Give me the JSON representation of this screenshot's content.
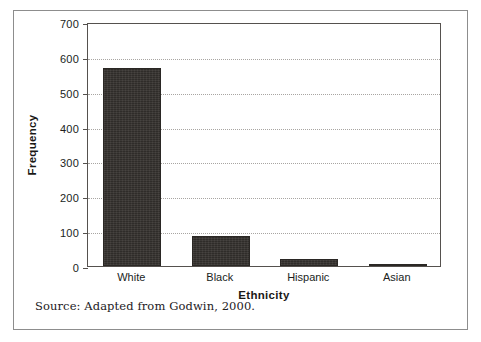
{
  "figure": {
    "source_note": "Source: Adapted from Godwin, 2000."
  },
  "chart_data": {
    "type": "bar",
    "title": "",
    "xlabel": "Ethnicity",
    "ylabel": "Frequency",
    "categories": [
      "White",
      "Black",
      "Hispanic",
      "Asian"
    ],
    "values": [
      567,
      87,
      20,
      5
    ],
    "ylim": [
      0,
      700
    ],
    "yticks": [
      0,
      100,
      200,
      300,
      400,
      500,
      600,
      700
    ],
    "ytick_labels": [
      "0",
      "100",
      "200",
      "300",
      "400",
      "500",
      "600",
      "700"
    ],
    "grid": "horizontal-dotted",
    "legend": "none",
    "bar_color": "#35312e",
    "grid_color": "#a8a5a2",
    "axis_color": "#55514e"
  }
}
